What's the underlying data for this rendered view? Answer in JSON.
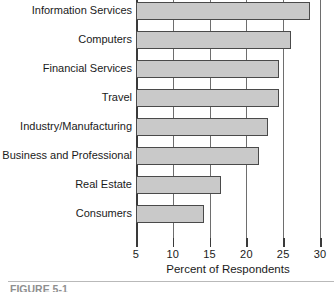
{
  "chart_data": {
    "type": "bar",
    "orientation": "horizontal",
    "title": "",
    "xlabel": "Percent of Respondents",
    "ylabel": "",
    "xlim": [
      5,
      30
    ],
    "xticks": [
      5,
      10,
      15,
      20,
      25,
      30
    ],
    "xticklabels": [
      "5",
      "10",
      "15",
      "20",
      "25",
      "30"
    ],
    "grid": "vertical",
    "legend": "none",
    "categories": [
      "Information Services",
      "Computers",
      "Financial Services",
      "Travel",
      "Industry/Manufacturing",
      "Business and Professional",
      "Real Estate",
      "Consumers"
    ],
    "values": [
      28.6,
      26.1,
      24.4,
      24.4,
      22.9,
      21.7,
      16.6,
      14.2
    ],
    "bar_color": "#c9c9c9",
    "bar_edge_color": "#4a4a4a"
  },
  "axis": {
    "x_title": "Percent of Respondents",
    "ticks": [
      {
        "label": "5",
        "value": 5
      },
      {
        "label": "10",
        "value": 10
      },
      {
        "label": "15",
        "value": 15
      },
      {
        "label": "20",
        "value": 20
      },
      {
        "label": "25",
        "value": 25
      },
      {
        "label": "30",
        "value": 30
      }
    ]
  },
  "caption": {
    "text": "FIGURE 5-1"
  }
}
